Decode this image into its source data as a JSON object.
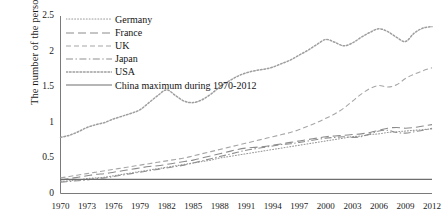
{
  "chart_data": {
    "type": "line",
    "title": "",
    "subtitle": "",
    "xlabel": "",
    "ylabel": "The number of the persons",
    "xlim": [
      1970,
      2012
    ],
    "ylim": [
      0,
      2.5
    ],
    "grid": false,
    "legend_position": "upper-left inside",
    "yticks": [
      "0",
      "0.5",
      "1",
      "1.5",
      "2",
      "2.5"
    ],
    "ytick_values": [
      0,
      0.5,
      1,
      1.5,
      2,
      2.5
    ],
    "xticks": [
      "1970",
      "1973",
      "1976",
      "1979",
      "1982",
      "1985",
      "1988",
      "1991",
      "1994",
      "1997",
      "2000",
      "2003",
      "2006",
      "2009",
      "2012"
    ],
    "xtick_values": [
      1970,
      1973,
      1976,
      1979,
      1982,
      1985,
      1988,
      1991,
      1994,
      1997,
      2000,
      2003,
      2006,
      2009,
      2012
    ],
    "x": [
      1970,
      1971,
      1972,
      1973,
      1974,
      1975,
      1976,
      1977,
      1978,
      1979,
      1980,
      1981,
      1982,
      1983,
      1984,
      1985,
      1986,
      1987,
      1988,
      1989,
      1990,
      1991,
      1992,
      1993,
      1994,
      1995,
      1996,
      1997,
      1998,
      1999,
      2000,
      2001,
      2002,
      2003,
      2004,
      2005,
      2006,
      2007,
      2008,
      2009,
      2010,
      2011,
      2012
    ],
    "series": [
      {
        "name": "Germany",
        "style": "dotted-fine",
        "color": "#9a9a9a",
        "values": [
          0.17,
          0.18,
          0.19,
          0.21,
          0.22,
          0.23,
          0.25,
          0.27,
          0.29,
          0.31,
          0.33,
          0.35,
          0.37,
          0.39,
          0.41,
          0.43,
          0.45,
          0.47,
          0.5,
          0.52,
          0.54,
          0.56,
          0.58,
          0.6,
          0.62,
          0.64,
          0.66,
          0.68,
          0.7,
          0.72,
          0.74,
          0.76,
          0.78,
          0.8,
          0.81,
          0.83,
          0.84,
          0.86,
          0.87,
          0.88,
          0.89,
          0.9,
          0.91
        ]
      },
      {
        "name": "France",
        "style": "long-dash",
        "color": "#8c8c8c",
        "values": [
          0.19,
          0.21,
          0.23,
          0.25,
          0.27,
          0.28,
          0.3,
          0.32,
          0.34,
          0.36,
          0.38,
          0.39,
          0.41,
          0.43,
          0.45,
          0.47,
          0.5,
          0.53,
          0.56,
          0.59,
          0.62,
          0.64,
          0.65,
          0.66,
          0.68,
          0.7,
          0.72,
          0.74,
          0.76,
          0.78,
          0.8,
          0.81,
          0.82,
          0.83,
          0.84,
          0.86,
          0.89,
          0.92,
          0.93,
          0.92,
          0.93,
          0.95,
          0.97
        ]
      },
      {
        "name": "UK",
        "style": "dashed",
        "color": "#a6a6a6",
        "values": [
          0.22,
          0.24,
          0.26,
          0.28,
          0.3,
          0.32,
          0.34,
          0.36,
          0.38,
          0.4,
          0.42,
          0.44,
          0.46,
          0.48,
          0.5,
          0.53,
          0.56,
          0.59,
          0.62,
          0.65,
          0.68,
          0.71,
          0.74,
          0.77,
          0.8,
          0.83,
          0.86,
          0.9,
          0.95,
          1.0,
          1.06,
          1.12,
          1.2,
          1.3,
          1.4,
          1.48,
          1.52,
          1.5,
          1.53,
          1.62,
          1.68,
          1.73,
          1.77
        ]
      },
      {
        "name": "Japan",
        "style": "dash-dot",
        "color": "#8f8f8f",
        "values": [
          0.16,
          0.17,
          0.18,
          0.19,
          0.21,
          0.22,
          0.24,
          0.26,
          0.28,
          0.3,
          0.32,
          0.34,
          0.36,
          0.38,
          0.4,
          0.43,
          0.46,
          0.49,
          0.52,
          0.55,
          0.58,
          0.61,
          0.63,
          0.65,
          0.67,
          0.69,
          0.7,
          0.72,
          0.74,
          0.76,
          0.78,
          0.79,
          0.8,
          0.79,
          0.8,
          0.84,
          0.88,
          0.89,
          0.86,
          0.85,
          0.87,
          0.89,
          0.92
        ]
      },
      {
        "name": "USA",
        "style": "dotted",
        "color": "#9e9e9e",
        "values": [
          0.79,
          0.82,
          0.87,
          0.93,
          0.97,
          1.0,
          1.05,
          1.09,
          1.13,
          1.18,
          1.28,
          1.38,
          1.46,
          1.38,
          1.3,
          1.28,
          1.32,
          1.4,
          1.5,
          1.58,
          1.65,
          1.7,
          1.73,
          1.75,
          1.78,
          1.83,
          1.88,
          1.95,
          2.02,
          2.1,
          2.17,
          2.13,
          2.08,
          2.12,
          2.2,
          2.27,
          2.32,
          2.28,
          2.2,
          2.14,
          2.26,
          2.33,
          2.35
        ]
      },
      {
        "name": "China maximum during 1970-2012",
        "style": "solid",
        "color": "#6e6e6e",
        "values": [
          0.2,
          0.2,
          0.2,
          0.2,
          0.2,
          0.2,
          0.2,
          0.2,
          0.2,
          0.2,
          0.2,
          0.2,
          0.2,
          0.2,
          0.2,
          0.2,
          0.2,
          0.2,
          0.2,
          0.2,
          0.2,
          0.2,
          0.2,
          0.2,
          0.2,
          0.2,
          0.2,
          0.2,
          0.2,
          0.2,
          0.2,
          0.2,
          0.2,
          0.2,
          0.2,
          0.2,
          0.2,
          0.2,
          0.2,
          0.2,
          0.2,
          0.2,
          0.2
        ]
      }
    ]
  },
  "legend": {
    "entries": [
      {
        "label": "Germany",
        "key": "germany"
      },
      {
        "label": "France",
        "key": "france"
      },
      {
        "label": "UK",
        "key": "uk"
      },
      {
        "label": "Japan",
        "key": "japan"
      },
      {
        "label": "USA",
        "key": "usa"
      },
      {
        "label": "China maximum during 1970-2012",
        "key": "china"
      }
    ]
  },
  "axes": {
    "y_title": "The number of the persons",
    "y_labels": [
      "2.5",
      "2",
      "1.5",
      "1",
      "0.5",
      "0"
    ],
    "x_labels": [
      "1970",
      "1973",
      "1976",
      "1979",
      "1982",
      "1985",
      "1988",
      "1991",
      "1994",
      "1997",
      "2000",
      "2003",
      "2006",
      "2009",
      "2012"
    ]
  },
  "colors": {
    "axis": "#6e6e6e",
    "text": "#141414",
    "background": "#ffffff"
  }
}
